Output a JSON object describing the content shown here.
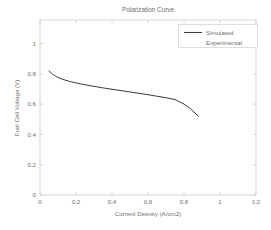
{
  "chart_data": {
    "type": "line",
    "title": "Polarization Curve",
    "xlabel": "Current Desnity (A/cm2)",
    "ylabel": "Fuel Cell Voltage (V)",
    "xlim": [
      0,
      1.2
    ],
    "ylim": [
      0,
      1.155
    ],
    "xticks": [
      0,
      0.2,
      0.4,
      0.6,
      0.8,
      1,
      1.2
    ],
    "xticklabels": [
      "0",
      "0.2",
      "0.4",
      "0.6",
      "0.8",
      "1",
      "1.2"
    ],
    "yticks": [
      0,
      0.2,
      0.4,
      0.6,
      0.8,
      1
    ],
    "yticklabels": [
      "0",
      "0.2",
      "0.4",
      "0.6",
      "0.8",
      "1"
    ],
    "grid": false,
    "legend_position": "top-right",
    "line_color": "#3b3b3b",
    "series": [
      {
        "name": "Simulated",
        "style": "solid",
        "color": "#3b3b3b",
        "x": [
          0.05,
          0.06,
          0.07,
          0.08,
          0.09,
          0.1,
          0.12,
          0.14,
          0.17,
          0.2,
          0.24,
          0.28,
          0.32,
          0.36,
          0.4,
          0.45,
          0.5,
          0.55,
          0.6,
          0.65,
          0.7,
          0.75,
          0.8,
          0.84,
          0.88
        ],
        "y": [
          0.82,
          0.807,
          0.797,
          0.789,
          0.782,
          0.776,
          0.766,
          0.758,
          0.748,
          0.74,
          0.73,
          0.721,
          0.713,
          0.705,
          0.698,
          0.689,
          0.68,
          0.671,
          0.662,
          0.652,
          0.642,
          0.63,
          0.6,
          0.565,
          0.52
        ]
      },
      {
        "name": "Experimental",
        "style": "none",
        "color": "#3b3b3b",
        "x": [],
        "y": []
      }
    ]
  },
  "legend": {
    "entries": [
      {
        "label": "Simulated",
        "has_line": true
      },
      {
        "label": "Experimental",
        "has_line": false
      }
    ]
  }
}
